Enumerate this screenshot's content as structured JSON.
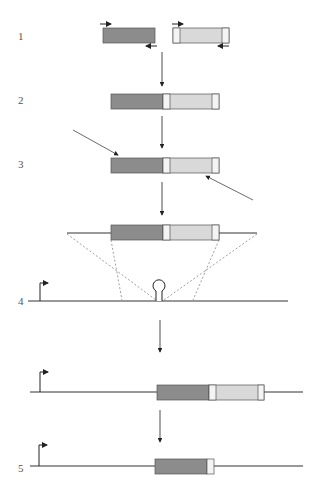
{
  "steps": [
    {
      "label": "1"
    },
    {
      "label": "2"
    },
    {
      "label": "3"
    },
    {
      "label": "4"
    },
    {
      "label": "5"
    }
  ],
  "colors": {
    "dark_segment": "#8c8c8c",
    "light_segment": "#d9d9d9",
    "spacer": "#f4f4f4",
    "line": "#333333",
    "dashed": "#777777",
    "label": "#555555"
  },
  "components": {
    "fragment_a": "dark gray cassette",
    "fragment_b": "light gray cassette with flanking spacers",
    "promoter": "bent-arrow promoter",
    "target_site": "hairpin loop on chromosome"
  }
}
